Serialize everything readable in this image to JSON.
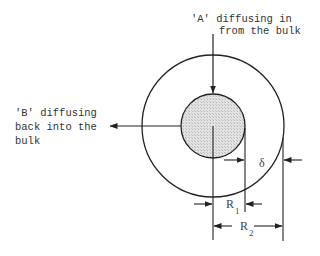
{
  "diagram": {
    "labels": {
      "a_line1": "'A' diffusing in",
      "a_line2": "from the bulk",
      "b_line1": "'B' diffusing",
      "b_line2": "back into the",
      "b_line3": "bulk",
      "delta": "δ",
      "r1": "R",
      "r1_sub": "1",
      "r2": "R",
      "r2_sub": "2"
    },
    "colors": {
      "stroke": "#222222",
      "inner_fill": "#d6d6d6",
      "background": "#ffffff"
    },
    "shapes": {
      "inner_circle": "particle core (shaded)",
      "outer_circle": "diffusion film boundary"
    }
  }
}
